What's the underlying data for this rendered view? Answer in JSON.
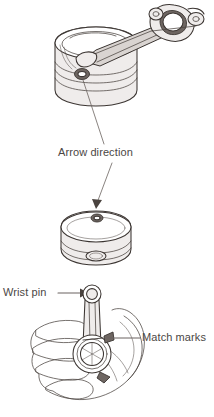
{
  "figure": {
    "background_color": "#ffffff",
    "ink_color": "#3b3532",
    "label_color": "#4b4745",
    "width": 214,
    "height": 417,
    "style": "line-art technical service illustration"
  },
  "labels": {
    "arrow_direction": "Arrow direction",
    "wrist_pin": "Wrist pin",
    "match_marks": "Match marks"
  },
  "panels": [
    {
      "id": "panel-top",
      "name": "piston-with-connecting-rod",
      "description": "Piston shown in three-quarter view with connecting rod and bearing cap attached, rod extending to upper right"
    },
    {
      "id": "panel-middle",
      "name": "piston-crown-detail",
      "description": "Piston viewed from above showing the arrow mark stamped on the crown"
    },
    {
      "id": "panel-bottom",
      "name": "hand-holding-assembly",
      "description": "Hand holding piston and connecting rod assembly showing wrist pin and match marks"
    }
  ],
  "callouts": [
    {
      "name": "arrow-direction-callout",
      "label": "Arrow direction",
      "points_from": "piston-crown-mark-top-panel",
      "points_to": "piston-crown-mark-middle-panel"
    },
    {
      "name": "wrist-pin-callout",
      "label": "Wrist pin",
      "arrow": "right",
      "points_to": "small-end-eye"
    },
    {
      "name": "match-marks-callout",
      "label": "Match marks",
      "arrow": "left",
      "points_to": "rod-cap-parting-line"
    }
  ]
}
